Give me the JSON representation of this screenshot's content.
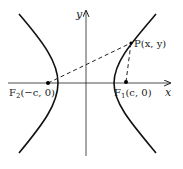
{
  "diagram": {
    "type": "hyperbola-foci",
    "axes": {
      "x_label": "x",
      "y_label": "y"
    },
    "points": {
      "P": {
        "label": "P(x, y)"
      },
      "F1": {
        "label_main": "F",
        "label_sub": "1",
        "label_rest": "(c, 0)"
      },
      "F2": {
        "label_main": "F",
        "label_sub": "2",
        "label_rest": "(−c, 0)"
      }
    },
    "colors": {
      "ink": "#222222",
      "background": "#ffffff"
    }
  }
}
